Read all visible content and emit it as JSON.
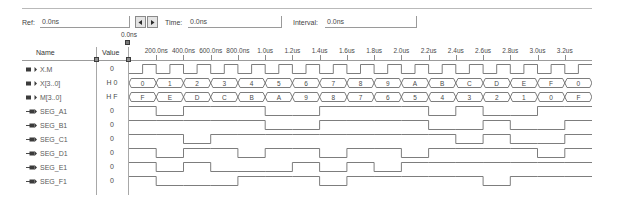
{
  "toolbar": {
    "ref_label": "Ref:",
    "ref_value": "0.0ns",
    "time_label": "Time:",
    "time_value": "0.0ns",
    "interval_label": "Interval:",
    "interval_value": "0.0ns",
    "spin_prev_icon": "left-arrow-icon",
    "spin_next_icon": "right-arrow-icon"
  },
  "cursor": {
    "label": "0.0ns"
  },
  "grid": {
    "header_name": "Name",
    "header_value": "Value"
  },
  "signals": [
    {
      "name": "X.M",
      "value": "0",
      "icon": "signal-icon",
      "type": "binary"
    },
    {
      "name": "X[3..0]",
      "value": "H 0",
      "icon": "bus-icon",
      "type": "bus"
    },
    {
      "name": "M[3..0]",
      "value": "H F",
      "icon": "bus-icon",
      "type": "bus"
    },
    {
      "name": "SEG_A1",
      "value": "0",
      "icon": "output-signal-icon",
      "type": "binary"
    },
    {
      "name": "SEG_B1",
      "value": "0",
      "icon": "output-signal-icon",
      "type": "binary"
    },
    {
      "name": "SEG_C1",
      "value": "0",
      "icon": "output-signal-icon",
      "type": "binary"
    },
    {
      "name": "SEG_D1",
      "value": "0",
      "icon": "output-signal-icon",
      "type": "binary"
    },
    {
      "name": "SEG_E1",
      "value": "0",
      "icon": "output-signal-icon",
      "type": "binary"
    },
    {
      "name": "SEG_F1",
      "value": "0",
      "icon": "output-signal-icon",
      "type": "binary"
    }
  ],
  "chart_data": {
    "type": "line",
    "xlabel": "Time",
    "ylabel": "",
    "grid": false,
    "legend": "none",
    "x_ticks": [
      "200.0ns",
      "400.0ns",
      "600.0ns",
      "800.0ns",
      "1.0us",
      "1.2us",
      "1.4us",
      "1.6us",
      "1.8us",
      "2.0us",
      "2.2us",
      "2.4us",
      "2.6us",
      "2.8us",
      "3.0us",
      "3.2us"
    ],
    "x_tick_times_ns": [
      200,
      400,
      600,
      800,
      1000,
      1200,
      1400,
      1600,
      1800,
      2000,
      2200,
      2400,
      2600,
      2800,
      3000,
      3200
    ],
    "xlim_ns": [
      0,
      3400
    ],
    "period_ns": 200,
    "series": [
      {
        "name": "X.M",
        "type": "clock",
        "values": [
          0,
          1,
          0,
          1,
          0,
          1,
          0,
          1,
          0,
          1,
          0,
          1,
          0,
          1,
          0,
          1,
          0,
          1,
          0,
          1,
          0,
          1,
          0,
          1,
          0,
          1,
          0,
          1,
          0,
          1,
          0,
          1,
          0,
          1
        ]
      },
      {
        "name": "X[3..0]",
        "type": "bus",
        "values": [
          "0",
          "1",
          "2",
          "3",
          "4",
          "5",
          "6",
          "7",
          "8",
          "9",
          "A",
          "B",
          "C",
          "D",
          "E",
          "F",
          "0"
        ]
      },
      {
        "name": "M[3..0]",
        "type": "bus",
        "values": [
          "F",
          "E",
          "D",
          "C",
          "B",
          "A",
          "9",
          "8",
          "7",
          "6",
          "5",
          "4",
          "3",
          "2",
          "1",
          "0",
          "F"
        ]
      },
      {
        "name": "SEG_A1",
        "type": "binary",
        "values": [
          1,
          0,
          1,
          1,
          1,
          0,
          0,
          1,
          1,
          1,
          1,
          0,
          1,
          0,
          0,
          1,
          1
        ]
      },
      {
        "name": "SEG_B1",
        "type": "binary",
        "values": [
          1,
          1,
          1,
          1,
          1,
          0,
          0,
          1,
          1,
          1,
          1,
          0,
          0,
          1,
          0,
          0,
          1
        ]
      },
      {
        "name": "SEG_C1",
        "type": "binary",
        "values": [
          1,
          1,
          0,
          1,
          1,
          1,
          1,
          1,
          1,
          1,
          1,
          1,
          0,
          1,
          0,
          0,
          1
        ]
      },
      {
        "name": "SEG_D1",
        "type": "binary",
        "values": [
          1,
          0,
          1,
          1,
          0,
          1,
          1,
          0,
          1,
          1,
          0,
          1,
          1,
          1,
          1,
          0,
          1
        ]
      },
      {
        "name": "SEG_E1",
        "type": "binary",
        "values": [
          1,
          0,
          1,
          0,
          0,
          0,
          1,
          0,
          1,
          0,
          1,
          1,
          1,
          1,
          1,
          1,
          1
        ]
      },
      {
        "name": "SEG_F1",
        "type": "binary",
        "values": [
          1,
          0,
          0,
          0,
          1,
          1,
          1,
          0,
          1,
          1,
          1,
          1,
          1,
          0,
          1,
          1,
          1
        ]
      }
    ]
  }
}
